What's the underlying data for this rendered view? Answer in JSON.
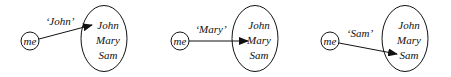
{
  "panels": [
    {
      "source": "me",
      "label": "‘John’",
      "set": [
        "John",
        "Mary",
        "Sam"
      ],
      "target_index": 0
    },
    {
      "source": "me",
      "label": "‘Mary’",
      "set": [
        "John",
        "Mary",
        "Sam"
      ],
      "target_index": 1
    },
    {
      "source": "me",
      "label": "‘Sam’",
      "set": [
        "John",
        "Mary",
        "Sam"
      ],
      "target_index": 2
    }
  ],
  "colors": {
    "stroke": "#111111",
    "background": "#ffffff"
  }
}
